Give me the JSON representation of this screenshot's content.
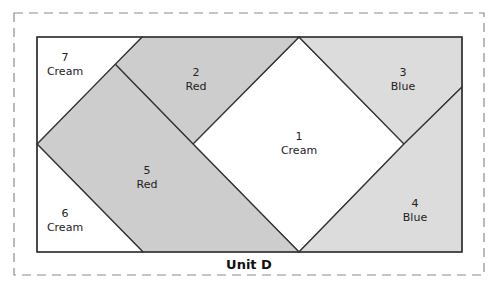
{
  "diagram": {
    "title": "Unit D",
    "colors": {
      "cream": "#ffffff",
      "red": "#cdcdcd",
      "blue": "#dcdcdc",
      "outline": "#333333",
      "dashed_border": "#8c8c8c"
    },
    "patches": [
      {
        "number": "1",
        "fabric": "Cream",
        "fill": "#ffffff",
        "points": "299,37 404,144 299,252 193,144",
        "label_x": 299,
        "label_y": 140
      },
      {
        "number": "2",
        "fabric": "Red",
        "fill": "#cdcdcd",
        "points": "142,37 299,37 193,144 115,64",
        "label_x": 196,
        "label_y": 76
      },
      {
        "number": "3",
        "fabric": "Blue",
        "fill": "#dcdcdc",
        "points": "299,37 462,37 462,87 404,144",
        "label_x": 403,
        "label_y": 76
      },
      {
        "number": "4",
        "fabric": "Blue",
        "fill": "#dcdcdc",
        "points": "404,144 462,87 462,252 299,252",
        "label_x": 415,
        "label_y": 207
      },
      {
        "number": "5",
        "fabric": "Red",
        "fill": "#cdcdcd",
        "points": "115,64 193,144 299,252 143,252 37,144",
        "label_x": 147,
        "label_y": 174
      },
      {
        "number": "6",
        "fabric": "Cream",
        "fill": "#ffffff",
        "points": "37,144 143,252 37,252",
        "label_x": 65,
        "label_y": 217
      },
      {
        "number": "7",
        "fabric": "Cream",
        "fill": "#ffffff",
        "points": "37,37 142,37 37,144",
        "label_x": 65,
        "label_y": 61
      }
    ]
  }
}
